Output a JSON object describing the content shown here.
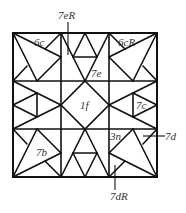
{
  "diagram": {
    "grid": {
      "rows": 3,
      "cols": 3
    },
    "labels": {
      "top_left": "6c",
      "top_right": "6cR",
      "top_callout": "7eR",
      "top_center": "7e",
      "center": "1f",
      "middle_right": "7c",
      "bottom_left": "7b",
      "bottom_right": "3n",
      "right_callout": "7d",
      "bottom_callout": "7dR"
    },
    "colors": {
      "line": "#111111",
      "label": "#333333",
      "background": "#ffffff"
    }
  }
}
